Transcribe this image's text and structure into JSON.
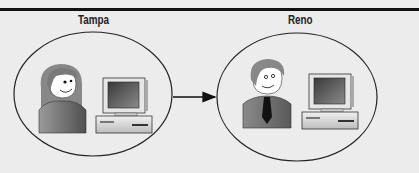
{
  "diagram": {
    "type": "site-to-site",
    "nodes": [
      {
        "id": "tampa",
        "label": "Tampa",
        "contents": [
          "user-female",
          "desktop-computer"
        ]
      },
      {
        "id": "reno",
        "label": "Reno",
        "contents": [
          "user-male",
          "desktop-computer"
        ]
      }
    ],
    "edges": [
      {
        "from": "tampa",
        "to": "reno",
        "style": "arrow"
      }
    ]
  },
  "colors": {
    "background": "#ececec",
    "stroke": "#111111",
    "skin": "#ffffff",
    "hair_female": "#8a8a8a",
    "shirt": "#6e6e6e",
    "monitor_screen": "#555555",
    "computer_body": "#d9d9d9"
  }
}
